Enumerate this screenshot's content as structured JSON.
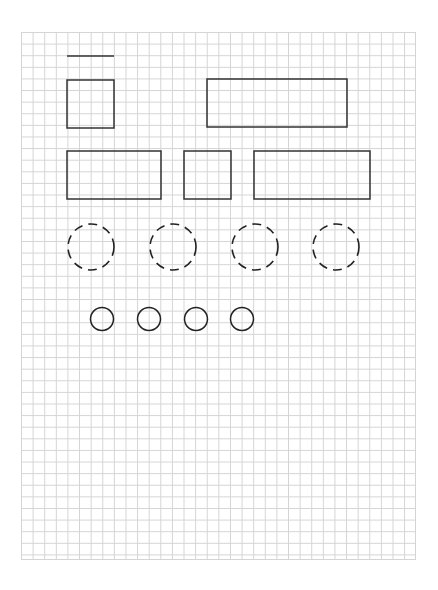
{
  "canvas": {
    "width": 438,
    "height": 590,
    "background": "#ffffff"
  },
  "grid": {
    "x": 21,
    "y": 32,
    "width": 395,
    "height": 528,
    "cell": 11.62,
    "line_color": "#d4d4d4"
  },
  "stroke_color": "#333333",
  "shapes": {
    "line": {
      "x1": 67,
      "y1": 56,
      "x2": 114,
      "y2": 56
    },
    "rects": [
      {
        "name": "square-top-left",
        "x": 67,
        "y": 80,
        "w": 47,
        "h": 48
      },
      {
        "name": "rect-top-right",
        "x": 207,
        "y": 79,
        "w": 140,
        "h": 48
      },
      {
        "name": "rect-mid-left",
        "x": 67,
        "y": 151,
        "w": 94,
        "h": 48
      },
      {
        "name": "square-mid-center",
        "x": 184,
        "y": 151,
        "w": 47,
        "h": 48
      },
      {
        "name": "rect-mid-right",
        "x": 254,
        "y": 151,
        "w": 116,
        "h": 48
      }
    ],
    "dashed_circles": [
      {
        "cx": 91,
        "cy": 247,
        "r": 23
      },
      {
        "cx": 173,
        "cy": 247,
        "r": 23
      },
      {
        "cx": 255,
        "cy": 247,
        "r": 23
      },
      {
        "cx": 336,
        "cy": 247,
        "r": 23
      }
    ],
    "small_circles": [
      {
        "cx": 102,
        "cy": 319,
        "r": 11.5
      },
      {
        "cx": 149,
        "cy": 319,
        "r": 11.5
      },
      {
        "cx": 196,
        "cy": 319,
        "r": 11.5
      },
      {
        "cx": 242,
        "cy": 319,
        "r": 11.5
      }
    ]
  }
}
